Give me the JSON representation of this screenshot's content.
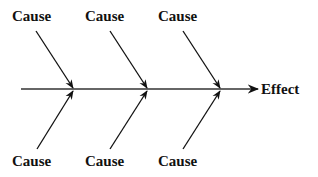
{
  "diagram": {
    "type": "fishbone",
    "effect": {
      "label": "Effect"
    },
    "causes_top": [
      {
        "label": "Cause"
      },
      {
        "label": "Cause"
      },
      {
        "label": "Cause"
      }
    ],
    "causes_bottom": [
      {
        "label": "Cause"
      },
      {
        "label": "Cause"
      },
      {
        "label": "Cause"
      }
    ],
    "colors": {
      "line": "#222222",
      "text": "#111111",
      "background": "#ffffff"
    }
  }
}
